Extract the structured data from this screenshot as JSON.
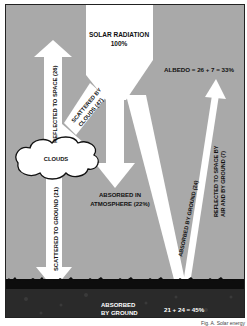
{
  "diagram": {
    "title": "SOLAR RADIATION",
    "title_value": "100%",
    "albedo_label": "ALBEDO = 26 + 7 = 33%",
    "clouds_label": "CLOUDS",
    "flows": {
      "reflected_to_space": "REFLECTED TO SPACE (26)",
      "scattered_by_clouds": [
        "SCATTERED BY",
        "CLOUDS (47)"
      ],
      "scattered_to_ground": "SCATTERED TO GROUND (21)",
      "absorbed_in_atmosphere": [
        "ABSORBED IN",
        "ATMOSPHERE (22%)"
      ],
      "absorbed_by_ground_direct": "ABSORBED BY GROUND (24)",
      "reflected_by_air_ground": [
        "REFLECTED TO SPACE BY",
        "AIR AND BY GROUND (7)"
      ]
    },
    "ground": {
      "label": [
        "ABSORBED",
        "BY GROUND"
      ],
      "sum": "21 + 24 = 45%"
    },
    "credit": "Fig. A. Solar energy",
    "colors": {
      "sky": "#a9a9a9",
      "beam": "#ffffff",
      "ground": "#1a1a1a",
      "grass": "#0d0d0d"
    }
  }
}
